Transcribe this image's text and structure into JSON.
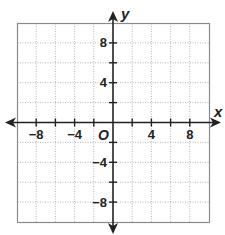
{
  "chart_data": {
    "type": "coordinate-grid",
    "title": "",
    "xlabel": "x",
    "ylabel": "y",
    "origin_label": "O",
    "xlim": [
      -10,
      10
    ],
    "ylim": [
      -10,
      10
    ],
    "grid": true,
    "grid_step": 2,
    "x_tick_labels": [
      {
        "value": -8,
        "text": "−8"
      },
      {
        "value": -4,
        "text": "−4"
      },
      {
        "value": 4,
        "text": "4"
      },
      {
        "value": 8,
        "text": "8"
      }
    ],
    "y_tick_labels": [
      {
        "value": 8,
        "text": "8"
      },
      {
        "value": 4,
        "text": "4"
      },
      {
        "value": -4,
        "text": "−4"
      },
      {
        "value": -8,
        "text": "−8"
      }
    ],
    "points": []
  },
  "colors": {
    "axis": "#222222",
    "border": "#8a8a8a",
    "grid": "#b0b0b0"
  }
}
